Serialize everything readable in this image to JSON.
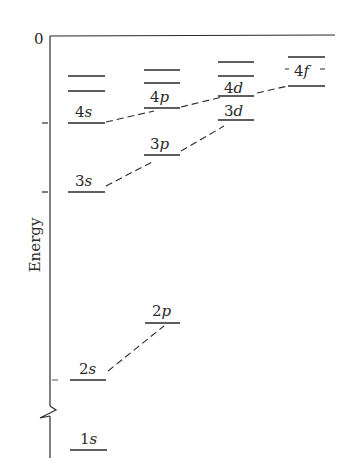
{
  "diagram": {
    "type": "energy-level-diagram",
    "axis": {
      "ylabel": "Energy",
      "zero_label": "0",
      "break_marker": true
    },
    "colors": {
      "ink": "#2a2a2a",
      "background": "#ffffff"
    },
    "columns": [
      {
        "name": "s",
        "levels": [
          {
            "label": "",
            "note": "unlabeled upper level"
          },
          {
            "label": "",
            "note": "unlabeled upper level"
          },
          {
            "label": "4s",
            "n": "4",
            "l": "s"
          },
          {
            "label": "3s",
            "n": "3",
            "l": "s"
          },
          {
            "label": "2s",
            "n": "2",
            "l": "s"
          },
          {
            "label": "1s",
            "n": "1",
            "l": "s"
          }
        ]
      },
      {
        "name": "p",
        "levels": [
          {
            "label": "",
            "note": "unlabeled upper level"
          },
          {
            "label": "",
            "note": "unlabeled upper level"
          },
          {
            "label": "4p",
            "n": "4",
            "l": "p"
          },
          {
            "label": "3p",
            "n": "3",
            "l": "p"
          },
          {
            "label": "2p",
            "n": "2",
            "l": "p"
          }
        ]
      },
      {
        "name": "d",
        "levels": [
          {
            "label": "",
            "note": "unlabeled upper level"
          },
          {
            "label": "",
            "note": "unlabeled upper level"
          },
          {
            "label": "4d",
            "n": "4",
            "l": "d"
          },
          {
            "label": "3d",
            "n": "3",
            "l": "d"
          }
        ]
      },
      {
        "name": "f",
        "levels": [
          {
            "label": "",
            "note": "unlabeled upper level"
          },
          {
            "label": "4f",
            "n": "4",
            "l": "f"
          }
        ]
      }
    ],
    "connections": [
      {
        "from": "2s",
        "to": "2p",
        "style": "dashed"
      },
      {
        "from": "3s",
        "to": "3p",
        "style": "dashed"
      },
      {
        "from": "3p",
        "to": "3d",
        "style": "dashed"
      },
      {
        "from": "4s",
        "to": "4p",
        "style": "dashed"
      },
      {
        "from": "4p",
        "to": "4d",
        "style": "dashed"
      },
      {
        "from": "4d",
        "to": "4f",
        "style": "dashed"
      }
    ],
    "labels": {
      "s4_n": "4",
      "s4_l": "s",
      "s3_n": "3",
      "s3_l": "s",
      "s2_n": "2",
      "s2_l": "s",
      "s1_n": "1",
      "s1_l": "s",
      "p4_n": "4",
      "p4_l": "p",
      "p3_n": "3",
      "p3_l": "p",
      "p2_n": "2",
      "p2_l": "p",
      "d4_n": "4",
      "d4_l": "d",
      "d3_n": "3",
      "d3_l": "d",
      "f4_n": "4",
      "f4_l": "f"
    }
  }
}
